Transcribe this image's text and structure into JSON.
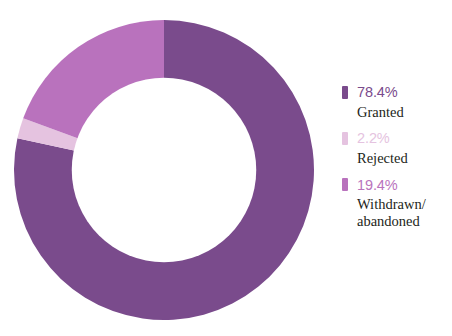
{
  "chart_data": {
    "type": "pie",
    "variant": "donut",
    "title": "",
    "subtitle": "",
    "xlabel": "",
    "ylabel": "",
    "grid": false,
    "legend_position": "right",
    "start_angle_deg": 0,
    "direction": "clockwise",
    "inner_radius_ratio": 0.615,
    "categories": [
      "Granted",
      "Rejected",
      "Withdrawn/\nabandoned"
    ],
    "values": [
      78.4,
      2.2,
      19.4
    ],
    "value_labels": [
      "78.4%",
      "2.2%",
      "19.4%"
    ],
    "colors": [
      "#7a4b8c",
      "#e5c3e0",
      "#b972bd"
    ],
    "units": "percent",
    "total": 100.0
  },
  "legend": {
    "items": [
      {
        "value": "78.4%",
        "label": "Granted",
        "color": "#7a4b8c",
        "value_color": "#7a4b8c"
      },
      {
        "value": "2.2%",
        "label": "Rejected",
        "color": "#e5c3e0",
        "value_color": "#e5c3e0"
      },
      {
        "value": "19.4%",
        "label": "Withdrawn/\nabandoned",
        "color": "#b972bd",
        "value_color": "#b972bd"
      }
    ]
  },
  "colors": {
    "granted": "#7a4b8c",
    "rejected": "#e5c3e0",
    "withdrawn": "#b972bd",
    "label_text": "#231f20",
    "background": "#ffffff"
  }
}
